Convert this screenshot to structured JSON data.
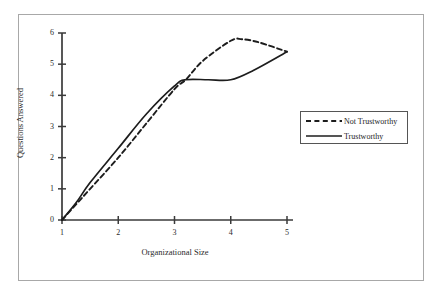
{
  "chart_data": {
    "type": "line",
    "title": "",
    "xlabel": "Organizational Size",
    "ylabel": "Questions Answered",
    "xlim": [
      1,
      5
    ],
    "ylim": [
      0,
      6
    ],
    "xticks": [
      "1",
      "2",
      "3",
      "4",
      "5"
    ],
    "yticks": [
      "0",
      "1",
      "2",
      "3",
      "4",
      "5",
      "6"
    ],
    "grid": false,
    "legend_position": "right",
    "series": [
      {
        "name": "Not Trustworthy",
        "style": "dashed",
        "color": "#1d1d1d",
        "x": [
          1,
          1.25,
          1.5,
          2,
          2.5,
          3,
          3.2,
          3.5,
          4,
          4.2,
          4.5,
          5
        ],
        "values": [
          0,
          0.5,
          1.0,
          2.0,
          3.1,
          4.2,
          4.5,
          5.1,
          5.75,
          5.8,
          5.7,
          5.4
        ]
      },
      {
        "name": "Trustworthy",
        "style": "solid",
        "color": "#1d1d1d",
        "x": [
          1,
          1.25,
          1.5,
          2,
          2.5,
          3,
          3.2,
          3.6,
          4,
          4.4,
          5
        ],
        "values": [
          0,
          0.55,
          1.2,
          2.3,
          3.4,
          4.3,
          4.5,
          4.5,
          4.5,
          4.8,
          5.4
        ]
      }
    ]
  },
  "legend": {
    "entries": [
      {
        "label": "Not Trustworthy"
      },
      {
        "label": "Trustworthy"
      }
    ]
  },
  "axes": {
    "x_title": "Organizational Size",
    "y_title": "Questions Answered"
  }
}
